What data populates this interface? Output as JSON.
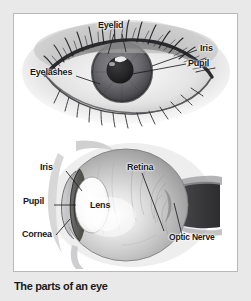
{
  "figure": {
    "caption": "The parts of an eye",
    "panels": [
      {
        "name": "front-view-eye",
        "labels": [
          {
            "id": "eyelid",
            "text": "Eyelid"
          },
          {
            "id": "iris",
            "text": "Iris"
          },
          {
            "id": "pupil",
            "text": "Pupil"
          },
          {
            "id": "eyelashes",
            "text": "Eyelashes"
          }
        ]
      },
      {
        "name": "cross-section-eye",
        "labels": [
          {
            "id": "iris",
            "text": "Iris"
          },
          {
            "id": "pupil",
            "text": "Pupil"
          },
          {
            "id": "cornea",
            "text": "Cornea"
          },
          {
            "id": "lens",
            "text": "Lens"
          },
          {
            "id": "retina",
            "text": "Retina"
          },
          {
            "id": "optic-nerve",
            "text": "Optic Nerve"
          }
        ]
      }
    ]
  },
  "colors": {
    "page_background": "#e9e9ea",
    "frame_background": "#ffffff",
    "frame_border": "#b9b9bb",
    "label_text": "#18181a",
    "caption_text": "#1b1b1d",
    "leader_line": "#1f1f21"
  }
}
